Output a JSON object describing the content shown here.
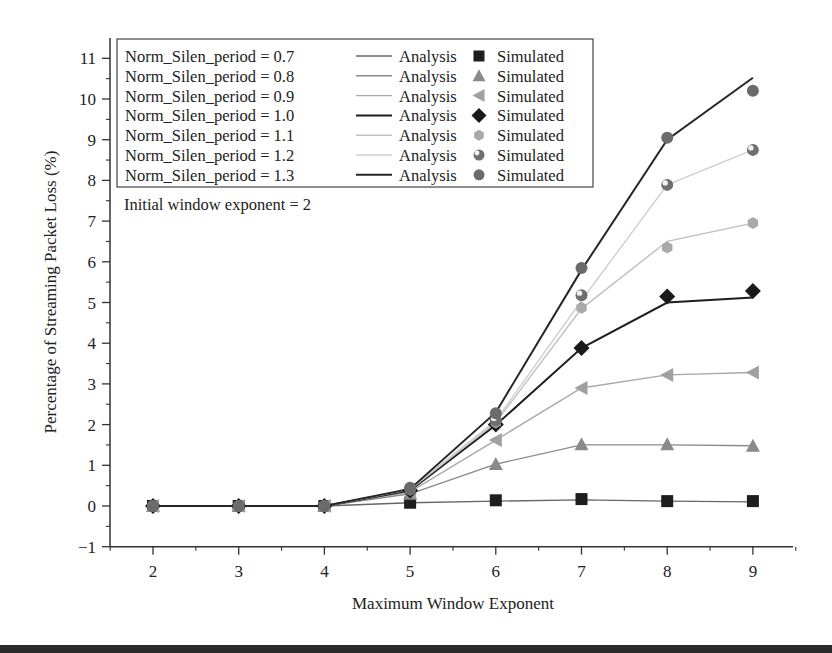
{
  "chart_data": {
    "type": "line",
    "title": "",
    "xlabel": "Maximum Window Exponent",
    "ylabel": "Percentage of Streaming Packet Loss (%)",
    "annotation": "Initial window exponent = 2",
    "x": [
      2,
      3,
      4,
      5,
      6,
      7,
      8,
      9
    ],
    "xlim": [
      1.5,
      9.5
    ],
    "ylim": [
      -1,
      11.5
    ],
    "xticks": [
      2,
      3,
      4,
      5,
      6,
      7,
      8,
      9
    ],
    "yticks": [
      -1,
      0,
      1,
      2,
      3,
      4,
      5,
      6,
      7,
      8,
      9,
      10,
      11
    ],
    "grid": false,
    "legend_position": "upper-left",
    "series": [
      {
        "name": "Norm_Silen_period = 0.7",
        "param": "0.7",
        "color": "#666666",
        "line_width": 1.4,
        "marker": "square",
        "marker_color": "#1e1e1e",
        "analysis": [
          0,
          0,
          0,
          0.08,
          0.12,
          0.15,
          0.12,
          0.1
        ],
        "simulated": [
          0,
          0,
          0,
          0.08,
          0.14,
          0.17,
          0.12,
          0.12
        ]
      },
      {
        "name": "Norm_Silen_period = 0.8",
        "param": "0.8",
        "color": "#8a8a8a",
        "line_width": 1.4,
        "marker": "triangle-up",
        "marker_color": "#8a8a8a",
        "analysis": [
          0,
          0,
          0,
          0.3,
          1.03,
          1.5,
          1.5,
          1.48
        ],
        "simulated": [
          0,
          0,
          0,
          0.3,
          1.03,
          1.52,
          1.52,
          1.48
        ]
      },
      {
        "name": "Norm_Silen_period = 0.9",
        "param": "0.9",
        "color": "#a8a8a8",
        "line_width": 1.4,
        "marker": "triangle-left",
        "marker_color": "#a0a0a0",
        "analysis": [
          0,
          0,
          0,
          0.35,
          1.62,
          2.9,
          3.22,
          3.28
        ],
        "simulated": [
          0,
          0,
          0,
          0.35,
          1.62,
          2.9,
          3.22,
          3.28
        ]
      },
      {
        "name": "Norm_Silen_period = 1.0",
        "param": "1.0",
        "color": "#1e1e1e",
        "line_width": 2,
        "marker": "diamond",
        "marker_color": "#1a1a1a",
        "analysis": [
          0,
          0,
          0,
          0.38,
          1.99,
          3.88,
          5.0,
          5.12
        ],
        "simulated": [
          0,
          0,
          0,
          0.38,
          2.0,
          3.88,
          5.15,
          5.28
        ]
      },
      {
        "name": "Norm_Silen_period = 1.1",
        "param": "1.1",
        "color": "#c0c0c0",
        "line_width": 1.4,
        "marker": "hexagon",
        "marker_color": "#a9a9a9",
        "analysis": [
          0,
          0,
          0,
          0.4,
          2.05,
          4.85,
          6.5,
          6.95
        ],
        "simulated": [
          0,
          0,
          0,
          0.4,
          2.05,
          4.87,
          6.35,
          6.95
        ]
      },
      {
        "name": "Norm_Silen_period = 1.2",
        "param": "1.2",
        "color": "#cfcfcf",
        "line_width": 1.4,
        "marker": "sphere",
        "marker_color": "#6f6f6f",
        "analysis": [
          0,
          0,
          0,
          0.42,
          2.1,
          5.05,
          7.89,
          8.75
        ],
        "simulated": [
          0,
          0,
          0,
          0.42,
          2.1,
          5.18,
          7.89,
          8.75
        ]
      },
      {
        "name": "Norm_Silen_period = 1.3",
        "param": "1.3",
        "color": "#262626",
        "line_width": 2,
        "marker": "circle",
        "marker_color": "#6b6b6b",
        "analysis": [
          0,
          0,
          0,
          0.42,
          2.3,
          5.8,
          9.0,
          10.52
        ],
        "simulated": [
          0,
          0,
          0,
          0.45,
          2.28,
          5.85,
          9.05,
          10.2
        ]
      }
    ]
  },
  "legend": {
    "analysis_label": "Analysis",
    "simulated_label": "Simulated"
  }
}
